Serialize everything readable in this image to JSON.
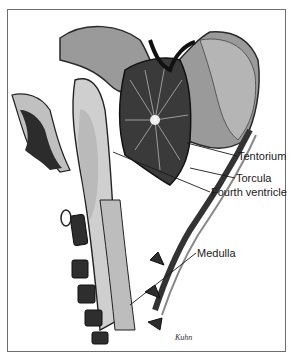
{
  "figure": {
    "labels": [
      {
        "id": "tentorium",
        "text": "Tentorium",
        "x": 238,
        "y": 150
      },
      {
        "id": "torcula",
        "text": "Torcula",
        "x": 236,
        "y": 172
      },
      {
        "id": "fourth-ventricle",
        "text": "Fourth ventricle",
        "x": 210,
        "y": 186
      },
      {
        "id": "medulla",
        "text": "Medulla",
        "x": 197,
        "y": 247
      }
    ],
    "leader_lines": [
      {
        "label": "tentorium",
        "x1": 187,
        "y1": 143,
        "x2": 237,
        "y2": 156
      },
      {
        "label": "torcula",
        "x1": 190,
        "y1": 168,
        "x2": 235,
        "y2": 178
      },
      {
        "label": "fourth-ventricle",
        "x1": 113,
        "y1": 152,
        "x2": 210,
        "y2": 192
      },
      {
        "label": "medulla",
        "x1": 130,
        "y1": 305,
        "x2": 196,
        "y2": 253
      }
    ],
    "signature": "Kuhn",
    "colors": {
      "frame": "#6e6e6e",
      "ink": "#1a1a1a",
      "dark": "#2a2a2a",
      "mid": "#8a8a8a",
      "light": "#c8c8c8"
    }
  }
}
